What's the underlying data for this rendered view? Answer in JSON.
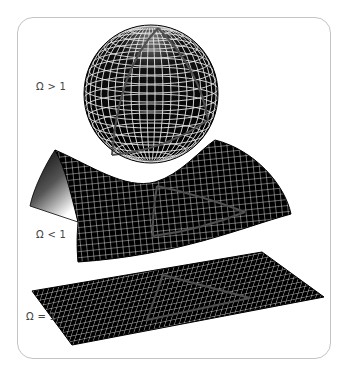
{
  "figure": {
    "colors": {
      "surface": "#000000",
      "grid": "#ffffff",
      "geodesic": "#4a4a4a",
      "frame": "#c4c4c4",
      "label": "#444444"
    },
    "panels": [
      {
        "id": "closed",
        "shape": "sphere",
        "label": "Ω > 1"
      },
      {
        "id": "open",
        "shape": "saddle",
        "label": "Ω < 1"
      },
      {
        "id": "flat",
        "shape": "plane",
        "label": "Ω = 1"
      }
    ]
  }
}
